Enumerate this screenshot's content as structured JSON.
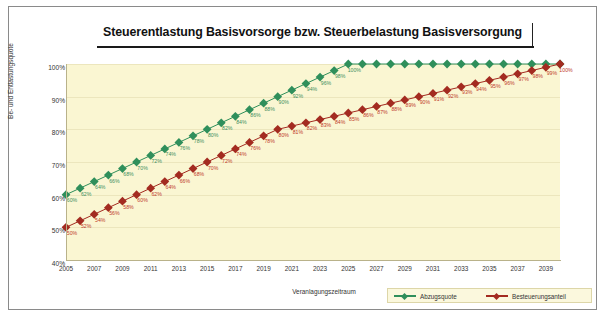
{
  "title": "Steuerentlastung Basisvorsorge bzw. Steuerbelastung Basisversorgung",
  "colors": {
    "green": "#2f8f5b",
    "red": "#a32b20",
    "plot_background": "#faf6d2",
    "frame_border": "#8a8a8a"
  },
  "chart_data": {
    "type": "line",
    "title": "Steuerentlastung Basisvorsorge bzw. Steuerbelastung Basisversorgung",
    "xlabel": "Veranlagungszeitraum",
    "ylabel": "Be- und Entlastungsquote",
    "ylim": [
      40,
      100
    ],
    "yticks": [
      "40%",
      "50%",
      "60%",
      "70%",
      "80%",
      "90%",
      "100%"
    ],
    "ytick_values": [
      40,
      50,
      60,
      70,
      80,
      90,
      100
    ],
    "xlim": [
      2005,
      2040
    ],
    "xticks": [
      "2005",
      "2007",
      "2009",
      "2011",
      "2013",
      "2015",
      "2017",
      "2019",
      "2021",
      "2023",
      "2025",
      "2027",
      "2029",
      "2031",
      "2033",
      "2035",
      "2037",
      "2039"
    ],
    "xtick_values": [
      2005,
      2007,
      2009,
      2011,
      2013,
      2015,
      2017,
      2019,
      2021,
      2023,
      2025,
      2027,
      2029,
      2031,
      2033,
      2035,
      2037,
      2039
    ],
    "x": [
      2005,
      2006,
      2007,
      2008,
      2009,
      2010,
      2011,
      2012,
      2013,
      2014,
      2015,
      2016,
      2017,
      2018,
      2019,
      2020,
      2021,
      2022,
      2023,
      2024,
      2025,
      2026,
      2027,
      2028,
      2029,
      2030,
      2031,
      2032,
      2033,
      2034,
      2035,
      2036,
      2037,
      2038,
      2039,
      2040
    ],
    "grid": true,
    "legend_position": "bottom-right",
    "series": [
      {
        "name": "Abzugsquote",
        "color": "#2f8f5b",
        "marker": "diamond",
        "values": [
          60,
          62,
          64,
          66,
          68,
          70,
          72,
          74,
          76,
          78,
          80,
          82,
          84,
          86,
          88,
          90,
          92,
          94,
          96,
          98,
          100,
          100,
          100,
          100,
          100,
          100,
          100,
          100,
          100,
          100,
          100,
          100,
          100,
          100,
          100,
          100
        ],
        "labels": [
          "60%",
          "62%",
          "64%",
          "66%",
          "68%",
          "70%",
          "72%",
          "74%",
          "76%",
          "78%",
          "80%",
          "82%",
          "84%",
          "86%",
          "88%",
          "90%",
          "92%",
          "94%",
          "96%",
          "98%",
          "100%",
          "",
          "",
          "",
          "",
          "",
          "",
          "",
          "",
          "",
          "",
          "",
          "",
          "",
          "",
          ""
        ]
      },
      {
        "name": "Besteuerungsanteil",
        "color": "#a32b20",
        "marker": "diamond",
        "values": [
          50,
          52,
          54,
          56,
          58,
          60,
          62,
          64,
          66,
          68,
          70,
          72,
          74,
          76,
          78,
          80,
          81,
          82,
          83,
          84,
          85,
          86,
          87,
          88,
          89,
          90,
          91,
          92,
          93,
          94,
          95,
          96,
          97,
          98,
          99,
          100
        ],
        "labels": [
          "50%",
          "52%",
          "54%",
          "56%",
          "58%",
          "60%",
          "62%",
          "64%",
          "66%",
          "68%",
          "70%",
          "72%",
          "74%",
          "76%",
          "78%",
          "80%",
          "81%",
          "82%",
          "83%",
          "84%",
          "85%",
          "86%",
          "87%",
          "88%",
          "89%",
          "90%",
          "91%",
          "92%",
          "93%",
          "94%",
          "95%",
          "96%",
          "97%",
          "98%",
          "99%",
          "100%"
        ]
      }
    ]
  },
  "legend": {
    "items": [
      {
        "label": "Abzugsquote",
        "color": "#2f8f5b"
      },
      {
        "label": "Besteuerungsanteil",
        "color": "#a32b20"
      }
    ]
  }
}
